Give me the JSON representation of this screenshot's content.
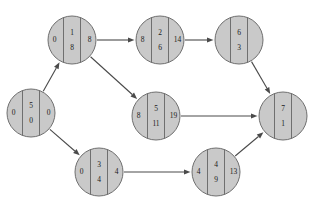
{
  "diagram": {
    "type": "activity-network-pert",
    "title": "",
    "node_fill_color": "#c9c9c9",
    "node_stroke_color": "#6f6f6f",
    "edge_color": "#4a4a4a",
    "background_color": "#ffffff",
    "nodes": [
      {
        "id": "start",
        "name": "start-node",
        "cx": 31,
        "cy": 113,
        "r": 24,
        "left": "0",
        "center_top": "5",
        "center_bottom": "0",
        "right": "0"
      },
      {
        "id": "n1",
        "name": "node-top-left",
        "cx": 72,
        "cy": 40,
        "r": 24,
        "left": "0",
        "center_top": "1",
        "center_bottom": "8",
        "right": "8"
      },
      {
        "id": "n2",
        "name": "node-top-middle",
        "cx": 160,
        "cy": 40,
        "r": 24,
        "left": "8",
        "center_top": "2",
        "center_bottom": "6",
        "right": "14"
      },
      {
        "id": "n3",
        "name": "node-top-right",
        "cx": 239,
        "cy": 40,
        "r": 24,
        "left": "",
        "center_top": "6",
        "center_bottom": "3",
        "right": ""
      },
      {
        "id": "n4",
        "name": "node-center",
        "cx": 156,
        "cy": 116,
        "r": 24,
        "left": "8",
        "center_top": "5",
        "center_bottom": "11",
        "right": "19"
      },
      {
        "id": "n5",
        "name": "node-bottom-left",
        "cx": 99,
        "cy": 172,
        "r": 24,
        "left": "0",
        "center_top": "3",
        "center_bottom": "4",
        "right": "4"
      },
      {
        "id": "n6",
        "name": "node-bottom-right",
        "cx": 216,
        "cy": 172,
        "r": 24,
        "left": "4",
        "center_top": "4",
        "center_bottom": "9",
        "right": "13"
      },
      {
        "id": "end",
        "name": "end-node",
        "cx": 283,
        "cy": 116,
        "r": 24,
        "left": "",
        "center_top": "7",
        "center_bottom": "1",
        "right": ""
      }
    ],
    "edges": [
      {
        "name": "edge-start-to-top-left",
        "from": "start",
        "to": "n1"
      },
      {
        "name": "edge-start-to-bottom-left",
        "from": "start",
        "to": "n5"
      },
      {
        "name": "edge-top-left-to-top-middle",
        "from": "n1",
        "to": "n2"
      },
      {
        "name": "edge-top-left-to-center",
        "from": "n1",
        "to": "n4"
      },
      {
        "name": "edge-top-middle-to-top-right",
        "from": "n2",
        "to": "n3"
      },
      {
        "name": "edge-top-right-to-end",
        "from": "n3",
        "to": "end"
      },
      {
        "name": "edge-center-to-end",
        "from": "n4",
        "to": "end"
      },
      {
        "name": "edge-bottom-left-to-bottom-right",
        "from": "n5",
        "to": "n6"
      },
      {
        "name": "edge-bottom-right-to-end",
        "from": "n6",
        "to": "end"
      }
    ]
  }
}
